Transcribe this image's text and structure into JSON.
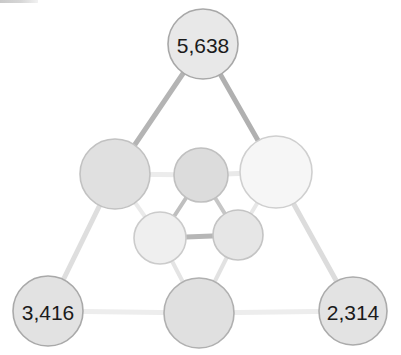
{
  "chart_data": {
    "type": "network",
    "title": "",
    "xlabel": "",
    "ylabel": "",
    "background": "#ffffff",
    "label_color": "#1b1b1b",
    "nodes": [
      {
        "id": "n-top",
        "name": "top-node",
        "label": "5,638",
        "value": 5638,
        "cx": 203,
        "cy": 44,
        "r": 35,
        "fill": "#e8e8e8",
        "stroke": "#a8a8a8"
      },
      {
        "id": "n-mid-left",
        "name": "middle-left-node",
        "label": "",
        "value": null,
        "cx": 115,
        "cy": 174,
        "r": 35,
        "fill": "#e0e0e0",
        "stroke": "#c2c2c2"
      },
      {
        "id": "n-mid-center",
        "name": "middle-center-node",
        "label": "",
        "value": null,
        "cx": 201,
        "cy": 175,
        "r": 27,
        "fill": "#dcdcdc",
        "stroke": "#c0c0c0"
      },
      {
        "id": "n-mid-right",
        "name": "middle-right-node",
        "label": "",
        "value": null,
        "cx": 276,
        "cy": 172,
        "r": 36,
        "fill": "#f6f6f6",
        "stroke": "#cfcfcf"
      },
      {
        "id": "n-inner-left",
        "name": "inner-lower-left-node",
        "label": "",
        "value": null,
        "cx": 160,
        "cy": 238,
        "r": 26,
        "fill": "#efefef",
        "stroke": "#cbcbcb"
      },
      {
        "id": "n-inner-right",
        "name": "inner-lower-right-node",
        "label": "",
        "value": null,
        "cx": 238,
        "cy": 235,
        "r": 25,
        "fill": "#e6e6e6",
        "stroke": "#c4c4c4"
      },
      {
        "id": "n-bottom-left",
        "name": "bottom-left-node",
        "label": "3,416",
        "value": 3416,
        "cx": 48,
        "cy": 311,
        "r": 35,
        "fill": "#e2e2e2",
        "stroke": "#a9a9a9"
      },
      {
        "id": "n-bottom-center",
        "name": "bottom-center-node",
        "label": "",
        "value": null,
        "cx": 199,
        "cy": 313,
        "r": 35,
        "fill": "#e0e0e0",
        "stroke": "#b0b0b0"
      },
      {
        "id": "n-bottom-right",
        "name": "bottom-right-node",
        "label": "2,314",
        "value": 2314,
        "cx": 353,
        "cy": 311,
        "r": 34,
        "fill": "#e3e3e3",
        "stroke": "#ababab"
      }
    ],
    "edges": [
      {
        "source": "n-top",
        "target": "n-mid-left",
        "width": 5,
        "color": "#b4b4b4"
      },
      {
        "source": "n-top",
        "target": "n-mid-right",
        "width": 5,
        "color": "#b0b0b0"
      },
      {
        "source": "n-mid-left",
        "target": "n-mid-center",
        "width": 5,
        "color": "#ececec"
      },
      {
        "source": "n-mid-center",
        "target": "n-mid-right",
        "width": 5,
        "color": "#e9e9e9"
      },
      {
        "source": "n-mid-center",
        "target": "n-inner-left",
        "width": 4,
        "color": "#bfbfbf"
      },
      {
        "source": "n-mid-center",
        "target": "n-inner-right",
        "width": 4,
        "color": "#c6c6c6"
      },
      {
        "source": "n-inner-left",
        "target": "n-inner-right",
        "width": 5,
        "color": "#b6b6b6"
      },
      {
        "source": "n-mid-left",
        "target": "n-inner-left",
        "width": 4,
        "color": "#eaeaea"
      },
      {
        "source": "n-mid-right",
        "target": "n-inner-right",
        "width": 4,
        "color": "#e7e7e7"
      },
      {
        "source": "n-mid-left",
        "target": "n-bottom-left",
        "width": 5,
        "color": "#dedede"
      },
      {
        "source": "n-mid-right",
        "target": "n-bottom-right",
        "width": 5,
        "color": "#dcdcdc"
      },
      {
        "source": "n-inner-left",
        "target": "n-bottom-center",
        "width": 4,
        "color": "#e4e4e4"
      },
      {
        "source": "n-inner-right",
        "target": "n-bottom-center",
        "width": 4,
        "color": "#e2e2e2"
      },
      {
        "source": "n-bottom-left",
        "target": "n-bottom-center",
        "width": 5,
        "color": "#ededed"
      },
      {
        "source": "n-bottom-center",
        "target": "n-bottom-right",
        "width": 5,
        "color": "#ededed"
      }
    ]
  }
}
